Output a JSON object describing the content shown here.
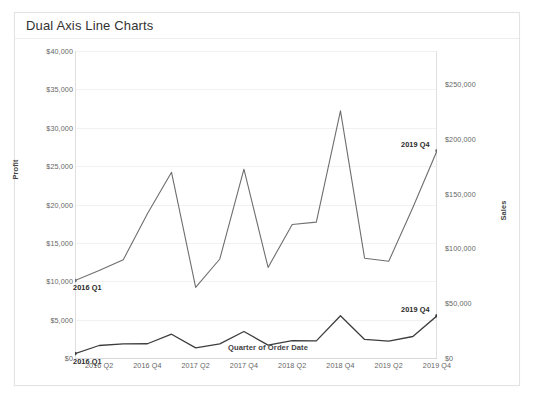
{
  "window": {
    "background": "#ffffff",
    "frame_border_color": "#e3e3e3"
  },
  "header": {
    "title": "Dual Axis Line Charts"
  },
  "chart_data": {
    "type": "line",
    "title": "Dual Axis Line Charts",
    "xlabel": "Quarter of Order Date",
    "grid": true,
    "legend_position": "none",
    "x": [
      "2016 Q1",
      "2016 Q2",
      "2016 Q3",
      "2016 Q4",
      "2017 Q1",
      "2017 Q2",
      "2017 Q3",
      "2017 Q4",
      "2018 Q1",
      "2018 Q2",
      "2018 Q3",
      "2018 Q4",
      "2019 Q1",
      "2019 Q2",
      "2019 Q3",
      "2019 Q4"
    ],
    "x_tick_labels": [
      "2016 Q2",
      "2016 Q4",
      "2017 Q2",
      "2017 Q4",
      "2018 Q2",
      "2018 Q4",
      "2019 Q2",
      "2019 Q4"
    ],
    "axes": [
      {
        "id": "left",
        "label": "Profit",
        "ylim": [
          0,
          40000
        ],
        "tick_step": 5000,
        "tick_labels": [
          "$0",
          "$5,000",
          "$10,000",
          "$15,000",
          "$20,000",
          "$25,000",
          "$30,000",
          "$35,000",
          "$40,000"
        ]
      },
      {
        "id": "right",
        "label": "Sales",
        "ylim": [
          0,
          280000
        ],
        "tick_step": 50000,
        "tick_labels": [
          "$0",
          "$50,000",
          "$100,000",
          "$150,000",
          "$200,000",
          "$250,000"
        ]
      }
    ],
    "series": [
      {
        "name": "Profit",
        "axis": "left",
        "color": "#6e6e6e",
        "stroke_width": 1.1,
        "values": [
          10100,
          11400,
          12800,
          18800,
          24200,
          9200,
          12900,
          24600,
          11800,
          17400,
          17700,
          32200,
          13000,
          12600,
          19600,
          27000
        ],
        "start_label": "2016 Q1",
        "end_label": "2019 Q4"
      },
      {
        "name": "Sales",
        "axis": "right",
        "color": "#3d3d3d",
        "stroke_width": 1.3,
        "values": [
          4000,
          11400,
          12900,
          13000,
          21700,
          9200,
          12900,
          24200,
          11700,
          15800,
          15600,
          38500,
          16900,
          15400,
          19600,
          38500
        ],
        "start_label": "2016 Q1",
        "end_label": "2019 Q4"
      }
    ],
    "point_labels": [
      {
        "text": "2016 Q1",
        "series": "Profit",
        "index": 0,
        "anchor": "below-left"
      },
      {
        "text": "2016 Q1",
        "series": "Sales",
        "index": 0,
        "anchor": "below-left"
      },
      {
        "text": "2019 Q4",
        "series": "Sales",
        "index": 15,
        "anchor": "above-left"
      },
      {
        "text": "2019 Q4",
        "series": "Profit",
        "index": 15,
        "anchor": "above-left"
      }
    ]
  }
}
